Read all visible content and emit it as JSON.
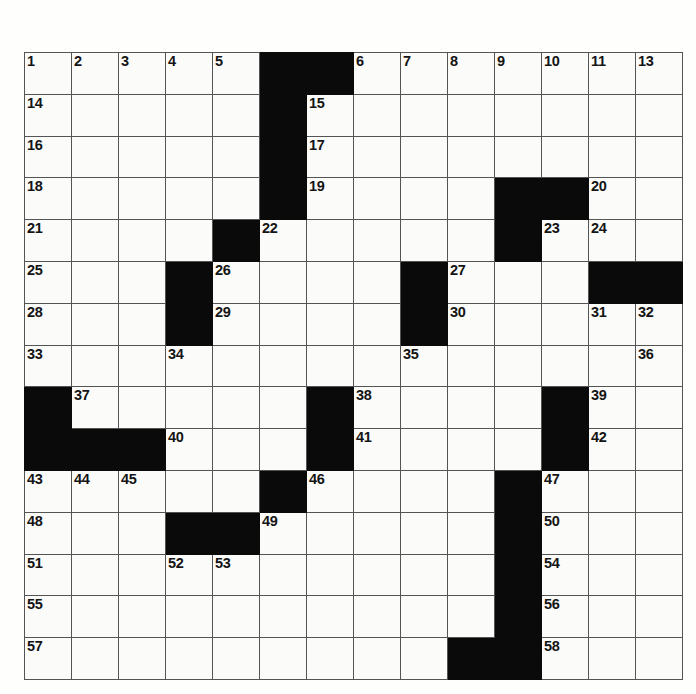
{
  "puzzle": {
    "type": "crossword-grid",
    "rows": 15,
    "cols": 14,
    "colors": {
      "block": "#0a0a0a",
      "open": "#fbfbf9",
      "grid_line": "#545454",
      "number_text": "#141414",
      "page_background": "#fefefd"
    },
    "numbers_visible": [
      1,
      2,
      3,
      4,
      5,
      6,
      7,
      8,
      9,
      10,
      11,
      12,
      13,
      14,
      15,
      16,
      17,
      18,
      19,
      20,
      21,
      22,
      23,
      24,
      25,
      26,
      27,
      28,
      29,
      30,
      31,
      32,
      33,
      34,
      35,
      36,
      37,
      38,
      39,
      40,
      41,
      42,
      43,
      44,
      45,
      46,
      47,
      48,
      49,
      50,
      51,
      52,
      53,
      54,
      55,
      56,
      57,
      58
    ],
    "max_number": 58,
    "cells": [
      [
        {
          "n": "1"
        },
        {
          "n": "2"
        },
        {
          "n": "3"
        },
        {
          "n": "4"
        },
        {
          "n": "5"
        },
        {
          "b": true
        },
        {
          "b": true
        },
        {
          "n": "6"
        },
        {
          "n": "7"
        },
        {
          "n": "8"
        },
        {
          "n": "9"
        },
        {
          "n": "10"
        },
        {
          "n": "11"
        },
        {
          "n": "12"
        }
      ],
      [
        {
          "n": "14"
        },
        {},
        {},
        {},
        {},
        {
          "b": true
        },
        {
          "n": "15"
        },
        {},
        {},
        {},
        {},
        {},
        {},
        {}
      ],
      [
        {
          "n": "16"
        },
        {},
        {},
        {},
        {},
        {
          "b": true
        },
        {
          "n": "17"
        },
        {},
        {},
        {},
        {},
        {},
        {},
        {}
      ],
      [
        {
          "n": "18"
        },
        {},
        {},
        {},
        {},
        {
          "b": true
        },
        {
          "n": "19"
        },
        {},
        {},
        {},
        {
          "b": true
        },
        {
          "b": true
        },
        {
          "n": "20"
        },
        {}
      ],
      [
        {
          "n": "21"
        },
        {},
        {},
        {},
        {
          "b": true
        },
        {
          "n": "22"
        },
        {},
        {},
        {},
        {},
        {
          "b": true
        },
        {
          "n": "23"
        },
        {
          "n": "24"
        },
        {}
      ],
      [
        {
          "n": "25"
        },
        {},
        {},
        {
          "b": true
        },
        {
          "n": "26"
        },
        {},
        {},
        {},
        {
          "b": true
        },
        {
          "n": "27"
        },
        {},
        {},
        {
          "b": true
        },
        {
          "b": true
        }
      ],
      [
        {
          "n": "28"
        },
        {},
        {},
        {
          "b": true
        },
        {
          "n": "29"
        },
        {},
        {},
        {},
        {
          "b": true
        },
        {
          "n": "30"
        },
        {},
        {},
        {
          "n": "31"
        },
        {
          "n": "32"
        }
      ],
      [
        {
          "n": "33"
        },
        {},
        {},
        {
          "n": "34"
        },
        {},
        {},
        {},
        {},
        {
          "n": "35"
        },
        {},
        {},
        {},
        {},
        {}
      ],
      [
        {
          "b": true
        },
        {
          "n": "37"
        },
        {},
        {},
        {},
        {},
        {
          "b": true
        },
        {
          "n": "38"
        },
        {},
        {},
        {},
        {
          "b": true
        },
        {
          "n": "39"
        },
        {}
      ],
      [
        {
          "b": true
        },
        {
          "b": true
        },
        {
          "b": true
        },
        {
          "n": "40"
        },
        {},
        {},
        {
          "b": true
        },
        {
          "n": "41"
        },
        {},
        {},
        {},
        {
          "b": true
        },
        {
          "n": "42"
        },
        {}
      ],
      [
        {
          "n": "43"
        },
        {
          "n": "44"
        },
        {
          "n": "45"
        },
        {},
        {},
        {
          "b": true
        },
        {
          "n": "46"
        },
        {},
        {},
        {},
        {
          "b": true
        },
        {
          "n": "47"
        },
        {},
        {}
      ],
      [
        {
          "n": "48"
        },
        {},
        {},
        {
          "b": true
        },
        {
          "b": true
        },
        {
          "n": "49"
        },
        {},
        {},
        {},
        {},
        {
          "b": true
        },
        {
          "n": "50"
        },
        {},
        {}
      ],
      [
        {
          "n": "51"
        },
        {},
        {},
        {
          "n": "52"
        },
        {
          "n": "53"
        },
        {},
        {},
        {},
        {},
        {},
        {
          "b": true
        },
        {
          "n": "54"
        },
        {},
        {}
      ],
      [
        {
          "n": "55"
        },
        {},
        {},
        {},
        {},
        {},
        {},
        {},
        {},
        {},
        {
          "b": true
        },
        {
          "n": "56"
        },
        {},
        {}
      ],
      [
        {
          "n": "57"
        },
        {},
        {},
        {},
        {},
        {},
        {},
        {},
        {},
        {
          "b": true
        },
        {
          "b": true
        },
        {
          "n": "58"
        },
        {},
        {}
      ]
    ],
    "row_extras": {
      "note_row0_col13": "13",
      "note_row7_col13": "36"
    }
  }
}
